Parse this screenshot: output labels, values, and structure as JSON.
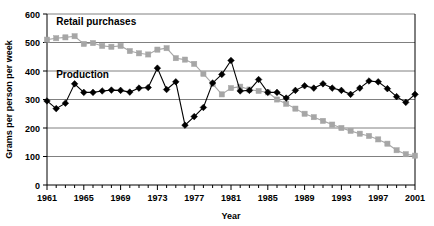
{
  "chart_data": {
    "type": "line",
    "title": "",
    "xlabel": "Year",
    "ylabel": "Grams per person per week",
    "xlim": [
      1961,
      2001
    ],
    "ylim": [
      0,
      600
    ],
    "ytick_step": 100,
    "yticks": [
      0,
      100,
      200,
      300,
      400,
      500,
      600
    ],
    "xticks_major": [
      1961,
      1965,
      1969,
      1973,
      1977,
      1981,
      1985,
      1989,
      1993,
      1997,
      2001
    ],
    "xtick_minor_step": 1,
    "grid": "horizontal",
    "legend": "inline-annotations",
    "x": [
      1961,
      1962,
      1963,
      1964,
      1965,
      1966,
      1967,
      1968,
      1969,
      1970,
      1971,
      1972,
      1973,
      1974,
      1975,
      1976,
      1977,
      1978,
      1979,
      1980,
      1981,
      1982,
      1983,
      1984,
      1985,
      1986,
      1987,
      1988,
      1989,
      1990,
      1991,
      1992,
      1993,
      1994,
      1995,
      1996,
      1997,
      1998,
      1999,
      2000,
      2001
    ],
    "series": [
      {
        "name": "Retail purchases",
        "color": "#a6a6a6",
        "marker": "square",
        "values": [
          510,
          515,
          518,
          522,
          495,
          498,
          488,
          485,
          488,
          470,
          462,
          458,
          475,
          480,
          445,
          440,
          425,
          390,
          355,
          318,
          340,
          345,
          335,
          330,
          325,
          300,
          285,
          268,
          250,
          238,
          225,
          212,
          200,
          190,
          180,
          172,
          160,
          145,
          122,
          108,
          103
        ]
      },
      {
        "name": "Production",
        "color": "#000000",
        "marker": "diamond",
        "values": [
          295,
          268,
          287,
          355,
          325,
          325,
          330,
          333,
          332,
          326,
          340,
          342,
          410,
          335,
          362,
          210,
          240,
          272,
          358,
          388,
          437,
          330,
          332,
          370,
          325,
          325,
          305,
          332,
          348,
          340,
          355,
          340,
          332,
          318,
          340,
          365,
          362,
          338,
          310,
          290,
          318
        ]
      }
    ],
    "annotations": [
      {
        "text": "Retail purchases",
        "x": 1962,
        "y": 560
      },
      {
        "text": "Production",
        "x": 1962,
        "y": 375
      }
    ]
  }
}
